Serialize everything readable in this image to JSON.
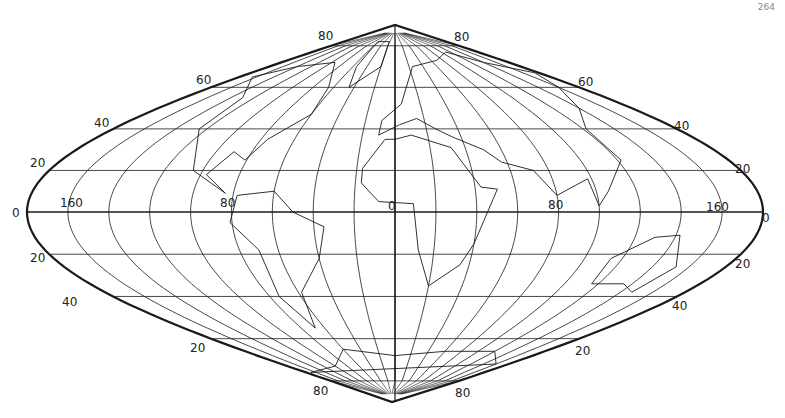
{
  "figure": {
    "projection": "sinusoidal (flat-polar at ±80°)",
    "corner_mark": "264",
    "colors": {
      "ink": "#1a1a1a",
      "background": "#ffffff"
    }
  },
  "geometry": {
    "cx": 395,
    "cy": 212,
    "half_width": 368,
    "height_north": 187,
    "height_south": 190,
    "pole_flat_lat": 80,
    "parallel_step": 20,
    "meridian_step": 20
  },
  "labels": {
    "latitude_left": [
      {
        "text": "80",
        "x": 318,
        "y": 40
      },
      {
        "text": "60",
        "x": 196,
        "y": 84
      },
      {
        "text": "40",
        "x": 94,
        "y": 127
      },
      {
        "text": "20",
        "x": 30,
        "y": 167
      },
      {
        "text": "0",
        "x": 12,
        "y": 217
      },
      {
        "text": "20",
        "x": 30,
        "y": 262
      },
      {
        "text": "40",
        "x": 62,
        "y": 306
      },
      {
        "text": "20",
        "x": 190,
        "y": 352
      },
      {
        "text": "80",
        "x": 313,
        "y": 395
      }
    ],
    "latitude_right": [
      {
        "text": "80",
        "x": 454,
        "y": 41
      },
      {
        "text": "60",
        "x": 578,
        "y": 86
      },
      {
        "text": "40",
        "x": 674,
        "y": 130
      },
      {
        "text": "20",
        "x": 735,
        "y": 173
      },
      {
        "text": "0",
        "x": 762,
        "y": 222
      },
      {
        "text": "20",
        "x": 735,
        "y": 268
      },
      {
        "text": "40",
        "x": 672,
        "y": 310
      },
      {
        "text": "20",
        "x": 575,
        "y": 355
      },
      {
        "text": "80",
        "x": 455,
        "y": 397
      }
    ],
    "longitude": [
      {
        "text": "160",
        "x": 60,
        "y": 207
      },
      {
        "text": "80",
        "x": 220,
        "y": 207
      },
      {
        "text": "0",
        "x": 388,
        "y": 210
      },
      {
        "text": "80",
        "x": 548,
        "y": 209
      },
      {
        "text": "160",
        "x": 706,
        "y": 211
      }
    ]
  }
}
